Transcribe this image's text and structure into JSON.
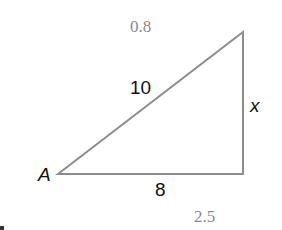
{
  "diagram": {
    "type": "right-triangle",
    "vertices": {
      "A": {
        "label": "A",
        "x": 58,
        "y": 174
      },
      "top": {
        "x": 243,
        "y": 32
      },
      "right_angle": {
        "x": 243,
        "y": 174
      }
    },
    "sides": {
      "hypotenuse": {
        "label": "10"
      },
      "vertical": {
        "label": "x"
      },
      "base": {
        "label": "8"
      }
    },
    "stroke_color": "#8c8c8c",
    "annotations": {
      "top": "0.8",
      "bottom": "2.5"
    }
  }
}
